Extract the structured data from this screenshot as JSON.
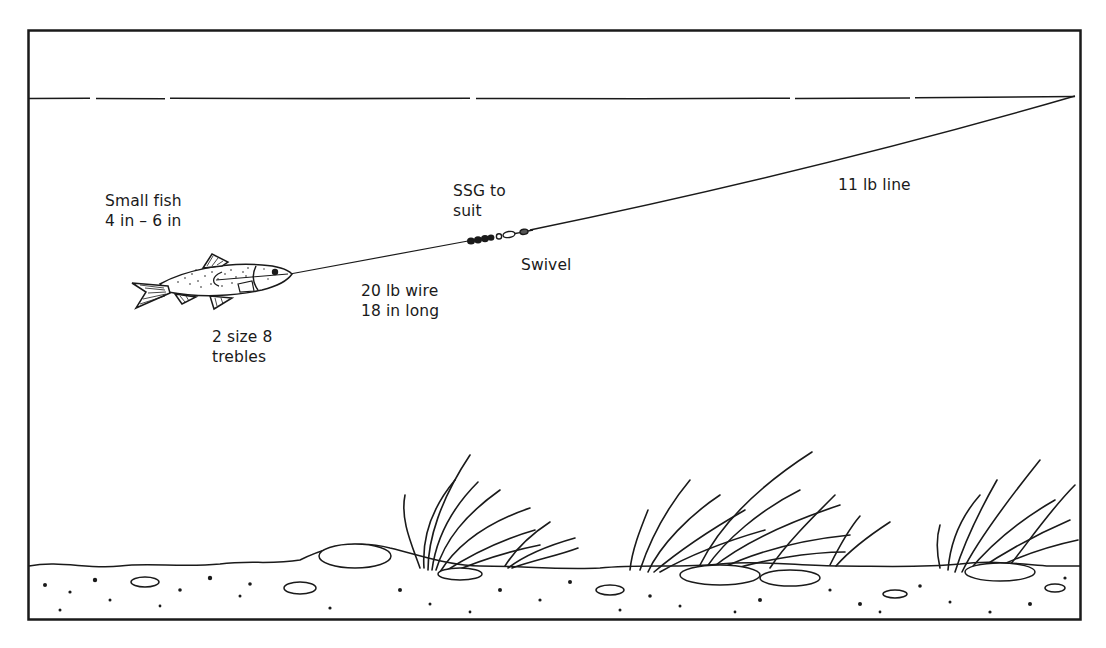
{
  "diagram": {
    "colors": {
      "ink": "#1a1a1a",
      "background": "#ffffff"
    },
    "labels": {
      "bait": {
        "line1": "Small fish",
        "line2": "4 in – 6 in"
      },
      "hooks": {
        "line1": "2 size 8",
        "line2": "trebles"
      },
      "trace": {
        "line1": "20 lb wire",
        "line2": "18 in long"
      },
      "weight": {
        "line1": "SSG to",
        "line2": "suit"
      },
      "swivel": {
        "line1": "Swivel"
      },
      "mainline": {
        "line1": "11 lb line"
      }
    },
    "elements": [
      "frame",
      "water-surface",
      "main-line",
      "wire-trace",
      "split-shot",
      "swivel",
      "bait-fish",
      "weed-clumps",
      "river-bed"
    ]
  }
}
